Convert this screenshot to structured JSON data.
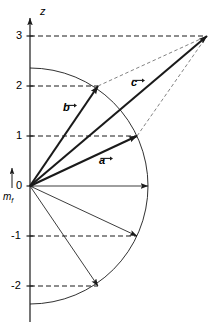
{
  "figure": {
    "background": "#ffffff",
    "line_color": "#1a1a1a",
    "size": {
      "width": 217,
      "height": 330
    }
  },
  "axis": {
    "label": "z",
    "label_pos": {
      "x": 40,
      "y": 6
    },
    "x_px": 30,
    "top_px": 18,
    "bottom_px": 322,
    "unit_px": 50,
    "origin": {
      "x": 30,
      "y": 186
    },
    "ticks": [
      {
        "value": "3",
        "y": 36,
        "label_x": 16,
        "label_y": 30
      },
      {
        "value": "2",
        "y": 86,
        "label_x": 16,
        "label_y": 80
      },
      {
        "value": "1",
        "y": 136,
        "label_x": 16,
        "label_y": 130
      },
      {
        "value": "0",
        "y": 186,
        "label_x": 16,
        "label_y": 180
      },
      {
        "value": "-1",
        "y": 236,
        "label_x": 11,
        "label_y": 230
      },
      {
        "value": "-2",
        "y": 286,
        "label_x": 11,
        "label_y": 280
      }
    ]
  },
  "mf_marker": {
    "label": "m",
    "subscript": "f",
    "label_pos": {
      "x": 3,
      "y": 192
    },
    "arrow_x": 12,
    "arrow_top_y": 168,
    "arrow_bottom_y": 188
  },
  "arc": {
    "center": {
      "x": 30,
      "y": 186
    },
    "radius": 118,
    "description": "right half circle arc from upper to lower"
  },
  "vectors": [
    {
      "name": "b",
      "label": "b",
      "label_pos": {
        "x": 63,
        "y": 103
      },
      "from": {
        "x": 30,
        "y": 186
      },
      "to": {
        "x": 98,
        "y": 86
      },
      "z_value": 2,
      "weight": "thick"
    },
    {
      "name": "c",
      "label": "c",
      "label_pos": {
        "x": 131,
        "y": 78
      },
      "from": {
        "x": 30,
        "y": 186
      },
      "to": {
        "x": 207,
        "y": 36
      },
      "z_value": 3,
      "weight": "thick"
    },
    {
      "name": "a",
      "label": "a",
      "label_pos": {
        "x": 99,
        "y": 156
      },
      "from": {
        "x": 30,
        "y": 186
      },
      "to": {
        "x": 137,
        "y": 136
      },
      "z_value": 1,
      "weight": "thick"
    },
    {
      "name": "r0",
      "label": "",
      "from": {
        "x": 30,
        "y": 186
      },
      "to": {
        "x": 148,
        "y": 186
      },
      "z_value": 0,
      "weight": "thin"
    },
    {
      "name": "rm1",
      "label": "",
      "from": {
        "x": 30,
        "y": 186
      },
      "to": {
        "x": 137,
        "y": 236
      },
      "z_value": -1,
      "weight": "thin"
    },
    {
      "name": "rm2",
      "label": "",
      "from": {
        "x": 30,
        "y": 186
      },
      "to": {
        "x": 98,
        "y": 286
      },
      "z_value": -2,
      "weight": "thin"
    }
  ],
  "dashed_levels": [
    {
      "z": 3,
      "x1": 30,
      "y": 36,
      "x2": 205
    },
    {
      "z": 2,
      "x1": 30,
      "y": 86,
      "x2": 98
    },
    {
      "z": 1,
      "x1": 30,
      "y": 136,
      "x2": 137
    },
    {
      "z": -1,
      "x1": 30,
      "y": 236,
      "x2": 137
    },
    {
      "z": -2,
      "x1": 30,
      "y": 286,
      "x2": 98
    }
  ],
  "construction_lines": [
    {
      "from": {
        "x": 98,
        "y": 86
      },
      "to": {
        "x": 207,
        "y": 36
      }
    },
    {
      "from": {
        "x": 137,
        "y": 136
      },
      "to": {
        "x": 207,
        "y": 36
      }
    }
  ],
  "chart_data": {
    "type": "scatter",
    "xlabel": "",
    "ylabel": "z",
    "ylim": [
      -2.6,
      3.2
    ],
    "grid": false,
    "legend": null,
    "tick_labels": [
      "3",
      "2",
      "1",
      "0",
      "-1",
      "-2"
    ],
    "annotations": [
      "z",
      "m_f",
      "a",
      "b",
      "c"
    ],
    "series": [
      {
        "name": "a",
        "x": [
          0,
          1.0
        ],
        "z": [
          0,
          1
        ]
      },
      {
        "name": "b",
        "x": [
          0,
          0.68
        ],
        "z": [
          0,
          2
        ]
      },
      {
        "name": "c",
        "x": [
          0,
          1.77
        ],
        "z": [
          0,
          3
        ]
      },
      {
        "name": "m=0",
        "x": [
          0,
          1.18
        ],
        "z": [
          0,
          0
        ]
      },
      {
        "name": "m=-1",
        "x": [
          0,
          1.07
        ],
        "z": [
          0,
          -1
        ]
      },
      {
        "name": "m=-2",
        "x": [
          0,
          0.68
        ],
        "z": [
          0,
          -2
        ]
      }
    ]
  }
}
